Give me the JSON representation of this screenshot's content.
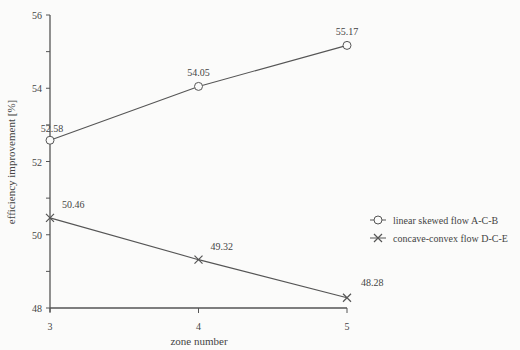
{
  "chart_data": {
    "type": "line",
    "title": "",
    "xlabel": "zone number",
    "ylabel": "efficiency improvement [%]",
    "x": [
      3,
      4,
      5
    ],
    "xticks": [
      "3",
      "4",
      "5"
    ],
    "yticks": [
      "48",
      "50",
      "52",
      "54",
      "56"
    ],
    "ylim": [
      48,
      56
    ],
    "xlim": [
      3,
      5
    ],
    "grid": false,
    "legend_position": "right-middle",
    "series": [
      {
        "name": "linear skewed flow A-C-B",
        "marker": "circle",
        "values": [
          52.58,
          54.05,
          55.17
        ],
        "labels": [
          "52.58",
          "54.05",
          "55.17"
        ]
      },
      {
        "name": "concave-convex flow D-C-E",
        "marker": "x",
        "values": [
          50.46,
          49.32,
          48.28
        ],
        "labels": [
          "50.46",
          "49.32",
          "48.28"
        ]
      }
    ]
  },
  "colors": {
    "line": "#555555",
    "text": "#444444",
    "background": "#fbfbfa"
  }
}
